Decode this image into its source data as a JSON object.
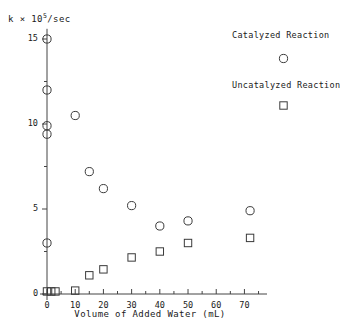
{
  "chart_data": {
    "type": "scatter",
    "title": "",
    "xlabel": "Volume of Added Water (mL)",
    "ylabel": "k × 10^5/sec",
    "ylabel_prefix": "k × 10",
    "ylabel_exponent": "5",
    "ylabel_suffix": "/sec",
    "xlim": [
      0,
      78
    ],
    "ylim": [
      0,
      16
    ],
    "grid": false,
    "legend_position": "top-right",
    "xticks": [
      0,
      10,
      20,
      30,
      40,
      50,
      60,
      70
    ],
    "xticklabels": [
      "0",
      "10",
      "20",
      "30",
      "40",
      "50",
      "60",
      "70"
    ],
    "xminor_step": 5,
    "yticks": [
      0,
      5,
      10,
      15
    ],
    "yticklabels": [
      "0",
      "5",
      "10",
      "15"
    ],
    "yminor_step": 2.5,
    "series": [
      {
        "name": "Catalyzed Reaction",
        "marker": "circle",
        "points": [
          {
            "x": 0,
            "y": 15.0
          },
          {
            "x": 0,
            "y": 12.0
          },
          {
            "x": 0,
            "y": 9.9
          },
          {
            "x": 0,
            "y": 9.4
          },
          {
            "x": 0,
            "y": 3.0
          },
          {
            "x": 10,
            "y": 10.5
          },
          {
            "x": 15,
            "y": 7.2
          },
          {
            "x": 20,
            "y": 6.2
          },
          {
            "x": 30,
            "y": 5.2
          },
          {
            "x": 40,
            "y": 4.0
          },
          {
            "x": 50,
            "y": 4.3
          },
          {
            "x": 72,
            "y": 4.9
          }
        ]
      },
      {
        "name": "Uncatalyzed Reaction",
        "marker": "square",
        "points": [
          {
            "x": 0,
            "y": 0.15
          },
          {
            "x": 1.5,
            "y": 0.15
          },
          {
            "x": 3,
            "y": 0.15
          },
          {
            "x": 10,
            "y": 0.2
          },
          {
            "x": 15,
            "y": 1.1
          },
          {
            "x": 20,
            "y": 1.45
          },
          {
            "x": 30,
            "y": 2.15
          },
          {
            "x": 40,
            "y": 2.5
          },
          {
            "x": 50,
            "y": 3.0
          },
          {
            "x": 72,
            "y": 3.3
          }
        ]
      }
    ]
  },
  "legend": {
    "entries": [
      {
        "label": "Catalyzed Reaction",
        "marker": "circle"
      },
      {
        "label": "Uncatalyzed Reaction",
        "marker": "square"
      }
    ]
  },
  "colors": {
    "axis": "#444444",
    "marker": "#3a3a3a",
    "text": "#1a1a1a",
    "background": "#ffffff"
  }
}
